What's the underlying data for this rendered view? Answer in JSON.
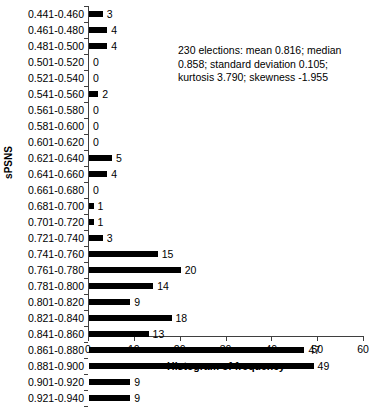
{
  "chart_data": {
    "type": "bar",
    "orientation": "horizontal",
    "title": "",
    "xlabel": "Histogram of frequency",
    "ylabel": "sPSNS",
    "xlim": [
      0,
      60
    ],
    "xticks": [
      0,
      10,
      20,
      30,
      40,
      50,
      60
    ],
    "grid": false,
    "legend": null,
    "bar_color": "#000000",
    "categories": [
      "0.441-0.460",
      "0.461-0.480",
      "0.481-0.500",
      "0.501-0.520",
      "0.521-0.540",
      "0.541-0.560",
      "0.561-0.580",
      "0.581-0.600",
      "0.601-0.620",
      "0.621-0.640",
      "0.641-0.660",
      "0.661-0.680",
      "0.681-0.700",
      "0.701-0.720",
      "0.721-0.740",
      "0.741-0.760",
      "0.761-0.780",
      "0.781-0.800",
      "0.801-0.820",
      "0.821-0.840",
      "0.841-0.860",
      "0.861-0.880",
      "0.881-0.900",
      "0.901-0.920",
      "0.921-0.940"
    ],
    "values": [
      3,
      4,
      4,
      0,
      0,
      2,
      0,
      0,
      0,
      5,
      4,
      0,
      1,
      1,
      3,
      15,
      20,
      14,
      9,
      18,
      13,
      47,
      49,
      9,
      9
    ],
    "annotation": "230 elections: mean 0.816; median 0.858; standard deviation 0.105; kurtosis 3.790; skewness -1.955"
  }
}
